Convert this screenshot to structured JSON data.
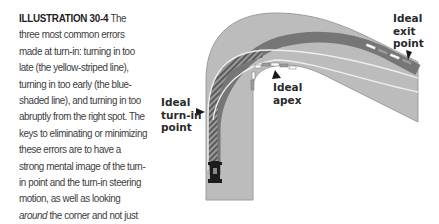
{
  "caption": {
    "label": "ILLUSTRATION 30-4",
    "text_before_italic": " The three most common errors made at turn-in: turning in too late (the yellow-striped line), turning in too early (the blue-shaded line), and turning in too abruptly from the right spot. The keys to eliminating or minimizing these errors are to have a strong mental image of the turn-in point and the turn-in steering motion, as well as looking ",
    "italic": "around",
    "text_after_italic": " the corner and not just through it."
  },
  "labels": {
    "turn_in": "Ideal\nturn-in\npoint",
    "apex": "Ideal\napex",
    "exit": "Ideal\nexit\npoint"
  },
  "colors": {
    "road": "#b9b9b9",
    "road_edge": "#a4a4a4",
    "early_line": "#6e6e6e",
    "late_stripe": "#8a8a8a",
    "ideal_line": "#f2f2f2",
    "arrow": "#1a1a1a"
  }
}
